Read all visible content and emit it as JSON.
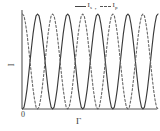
{
  "figure": {
    "background": "#ffffff",
    "axis_color": "#555555",
    "solid_color": "#3a3a3a",
    "dashed_color": "#666666"
  },
  "legend": {
    "separator": ",",
    "entries": [
      {
        "marker": "solid-line-swatch",
        "symbol": "I",
        "subscript": "s",
        "label": "I s"
      },
      {
        "marker": "dashed-line-swatch",
        "symbol": "I",
        "subscript": "p",
        "label": "I p"
      }
    ]
  },
  "axes": {
    "ylabel": "I",
    "xlabel": "Γ",
    "origin_label": "0"
  },
  "chart_data": {
    "type": "line",
    "title": "",
    "subtitle": "",
    "xlabel": "Γ",
    "ylabel": "I",
    "xlim": [
      0,
      4.5
    ],
    "ylim": [
      0,
      1
    ],
    "grid": false,
    "legend_position": "top-center",
    "x_tick_labels": [
      "0"
    ],
    "y_tick_labels": [],
    "series": [
      {
        "name": "I s",
        "style": "solid",
        "color": "#3a3a3a",
        "formula": "sin^2(pi*x)",
        "period": 1.0,
        "phase": 0.0,
        "amplitude": 1.0,
        "x": [
          0.0,
          0.05,
          0.1,
          0.15,
          0.2,
          0.25,
          0.3,
          0.35,
          0.4,
          0.45,
          0.5,
          0.55,
          0.6,
          0.65,
          0.7,
          0.75,
          0.8,
          0.85,
          0.9,
          0.95,
          1.0,
          1.05,
          1.1,
          1.15,
          1.2,
          1.25,
          1.3,
          1.35,
          1.4,
          1.45,
          1.5,
          1.55,
          1.6,
          1.65,
          1.7,
          1.75,
          1.8,
          1.85,
          1.9,
          1.95,
          2.0,
          2.05,
          2.1,
          2.15,
          2.2,
          2.25,
          2.3,
          2.35,
          2.4,
          2.45,
          2.5,
          2.55,
          2.6,
          2.65,
          2.7,
          2.75,
          2.8,
          2.85,
          2.9,
          2.95,
          3.0,
          3.05,
          3.1,
          3.15,
          3.2,
          3.25,
          3.3,
          3.35,
          3.4,
          3.45,
          3.5,
          3.55,
          3.6,
          3.65,
          3.7,
          3.75,
          3.8,
          3.85,
          3.9,
          3.95,
          4.0,
          4.05,
          4.1,
          4.15,
          4.2,
          4.25,
          4.3,
          4.35,
          4.4,
          4.45,
          4.5
        ],
        "y": [
          0.0,
          0.02,
          0.1,
          0.21,
          0.35,
          0.5,
          0.65,
          0.79,
          0.9,
          0.98,
          1.0,
          0.98,
          0.9,
          0.79,
          0.65,
          0.5,
          0.35,
          0.21,
          0.1,
          0.02,
          0.0,
          0.02,
          0.1,
          0.21,
          0.35,
          0.5,
          0.65,
          0.79,
          0.9,
          0.98,
          1.0,
          0.98,
          0.9,
          0.79,
          0.65,
          0.5,
          0.35,
          0.21,
          0.1,
          0.02,
          0.0,
          0.02,
          0.1,
          0.21,
          0.35,
          0.5,
          0.65,
          0.79,
          0.9,
          0.98,
          1.0,
          0.98,
          0.9,
          0.79,
          0.65,
          0.5,
          0.35,
          0.21,
          0.1,
          0.02,
          0.0,
          0.02,
          0.1,
          0.21,
          0.35,
          0.5,
          0.65,
          0.79,
          0.9,
          0.98,
          1.0,
          0.98,
          0.9,
          0.79,
          0.65,
          0.5,
          0.35,
          0.21,
          0.1,
          0.02,
          0.0,
          0.02,
          0.1,
          0.21,
          0.35,
          0.5,
          0.65,
          0.79,
          0.9,
          0.98,
          1.0
        ]
      },
      {
        "name": "I p",
        "style": "dashed",
        "color": "#666666",
        "formula": "cos^2(pi*x)",
        "period": 1.0,
        "phase": 0.5,
        "amplitude": 1.0,
        "x": [
          0.0,
          0.05,
          0.1,
          0.15,
          0.2,
          0.25,
          0.3,
          0.35,
          0.4,
          0.45,
          0.5,
          0.55,
          0.6,
          0.65,
          0.7,
          0.75,
          0.8,
          0.85,
          0.9,
          0.95,
          1.0,
          1.05,
          1.1,
          1.15,
          1.2,
          1.25,
          1.3,
          1.35,
          1.4,
          1.45,
          1.5,
          1.55,
          1.6,
          1.65,
          1.7,
          1.75,
          1.8,
          1.85,
          1.9,
          1.95,
          2.0,
          2.05,
          2.1,
          2.15,
          2.2,
          2.25,
          2.3,
          2.35,
          2.4,
          2.45,
          2.5,
          2.55,
          2.6,
          2.65,
          2.7,
          2.75,
          2.8,
          2.85,
          2.9,
          2.95,
          3.0,
          3.05,
          3.1,
          3.15,
          3.2,
          3.25,
          3.3,
          3.35,
          3.4,
          3.45,
          3.5,
          3.55,
          3.6,
          3.65,
          3.7,
          3.75,
          3.8,
          3.85,
          3.9,
          3.95,
          4.0,
          4.05,
          4.1,
          4.15,
          4.2,
          4.25,
          4.3,
          4.35,
          4.4,
          4.45,
          4.5
        ],
        "y": [
          1.0,
          0.98,
          0.9,
          0.79,
          0.65,
          0.5,
          0.35,
          0.21,
          0.1,
          0.02,
          0.0,
          0.02,
          0.1,
          0.21,
          0.35,
          0.5,
          0.65,
          0.79,
          0.9,
          0.98,
          1.0,
          0.98,
          0.9,
          0.79,
          0.65,
          0.5,
          0.35,
          0.21,
          0.1,
          0.02,
          0.0,
          0.02,
          0.1,
          0.21,
          0.35,
          0.5,
          0.65,
          0.79,
          0.9,
          0.98,
          1.0,
          0.98,
          0.9,
          0.79,
          0.65,
          0.5,
          0.35,
          0.21,
          0.1,
          0.02,
          0.0,
          0.02,
          0.1,
          0.21,
          0.35,
          0.5,
          0.65,
          0.79,
          0.9,
          0.98,
          1.0,
          0.98,
          0.9,
          0.79,
          0.65,
          0.5,
          0.35,
          0.21,
          0.1,
          0.02,
          0.0,
          0.02,
          0.1,
          0.21,
          0.35,
          0.5,
          0.65,
          0.79,
          0.9,
          0.98,
          1.0,
          0.98,
          0.9,
          0.79,
          0.65,
          0.5,
          0.35,
          0.21,
          0.1,
          0.02,
          0.0
        ]
      }
    ]
  }
}
